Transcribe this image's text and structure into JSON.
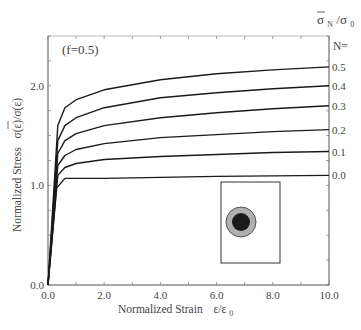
{
  "chart_data": {
    "type": "line",
    "title": "",
    "annotation": "(f=0.5)",
    "xlabel": "Normalized Strain",
    "xlabel_symbol": "ε/ε",
    "xlabel_subscript": "0",
    "ylabel": "Normalized Stress",
    "ylabel_symbol": "σ(ε)/σ(ε)",
    "right_header": "σ",
    "right_header_sub": "N",
    "right_header_den": "/σ",
    "right_header_den_sub": "0",
    "legend_title": "N=",
    "xlim": [
      0,
      10
    ],
    "ylim": [
      0,
      2.5
    ],
    "xticks": [
      0,
      2,
      4,
      6,
      8,
      10
    ],
    "xtick_labels": [
      "0.0",
      "2.0",
      "4.0",
      "6.0",
      "8.0",
      "10.0"
    ],
    "yticks": [
      0,
      1,
      2
    ],
    "ytick_labels": [
      "0.0",
      "1.0",
      "2.0"
    ],
    "grid": false,
    "legend_position": "right",
    "series": [
      {
        "name": "0.5",
        "x": [
          0,
          0.35,
          0.6,
          1.0,
          2.0,
          4.0,
          6.0,
          8.0,
          10.0
        ],
        "y": [
          0,
          1.6,
          1.78,
          1.86,
          1.96,
          2.06,
          2.12,
          2.16,
          2.19
        ]
      },
      {
        "name": "0.4",
        "x": [
          0,
          0.35,
          0.6,
          1.0,
          2.0,
          4.0,
          6.0,
          8.0,
          10.0
        ],
        "y": [
          0,
          1.45,
          1.6,
          1.68,
          1.78,
          1.88,
          1.93,
          1.97,
          2.0
        ]
      },
      {
        "name": "0.3",
        "x": [
          0,
          0.35,
          0.6,
          1.0,
          2.0,
          4.0,
          6.0,
          8.0,
          10.0
        ],
        "y": [
          0,
          1.32,
          1.45,
          1.52,
          1.6,
          1.68,
          1.73,
          1.77,
          1.8
        ]
      },
      {
        "name": "0.2",
        "x": [
          0,
          0.35,
          0.6,
          1.0,
          2.0,
          4.0,
          6.0,
          8.0,
          10.0
        ],
        "y": [
          0,
          1.2,
          1.3,
          1.36,
          1.42,
          1.48,
          1.51,
          1.54,
          1.56
        ]
      },
      {
        "name": "0.1",
        "x": [
          0,
          0.35,
          0.6,
          1.0,
          2.0,
          4.0,
          6.0,
          8.0,
          10.0
        ],
        "y": [
          0,
          1.1,
          1.18,
          1.22,
          1.26,
          1.29,
          1.31,
          1.33,
          1.34
        ]
      },
      {
        "name": "0.0",
        "x": [
          0,
          0.3,
          0.6,
          2.0,
          4.0,
          6.0,
          8.0,
          10.0
        ],
        "y": [
          0,
          0.97,
          1.07,
          1.07,
          1.08,
          1.09,
          1.095,
          1.1
        ]
      }
    ],
    "inset": {
      "description": "square unit cell with circular inclusion (dark core, gray shell)",
      "core_color": "#1a1a1a",
      "shell_color": "#b0b0b0"
    }
  },
  "colors": {
    "line": "#1a1a1a",
    "axis": "#777777",
    "text": "#444444"
  }
}
